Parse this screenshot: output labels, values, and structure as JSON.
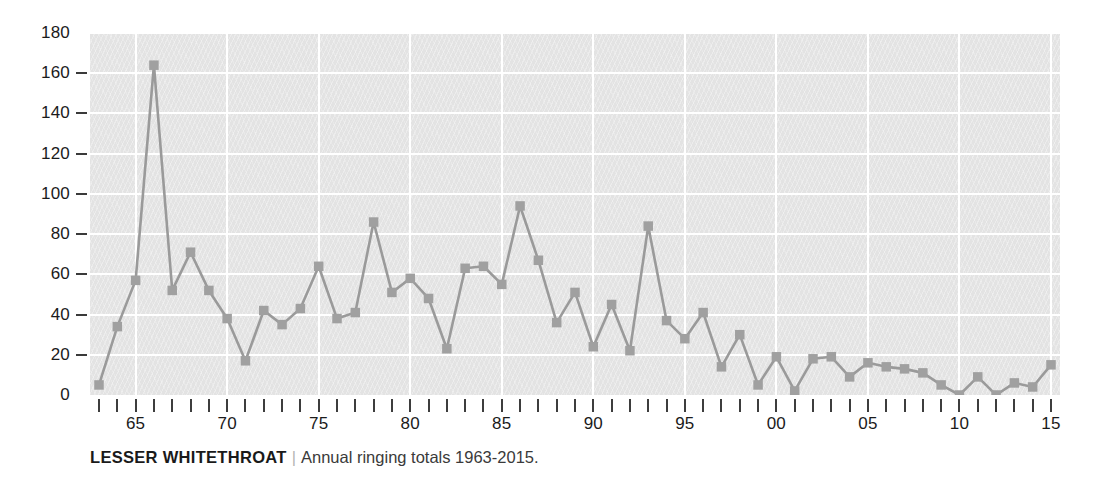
{
  "caption": {
    "title": "LESSER WHITETHROAT",
    "separator": "|",
    "subtitle": "Annual ringing totals 1963-2015."
  },
  "colors": {
    "plot_background": "#e3e3e3",
    "gridline": "#ffffff",
    "series_line": "#9a9a9a",
    "marker": "#a0a0a0",
    "axis_text": "#1b1b1b",
    "tick": "#3d3d3d",
    "page_background": "#ffffff"
  },
  "chart_data": {
    "type": "line",
    "title": "LESSER WHITETHROAT",
    "subtitle": "Annual ringing totals 1963-2015.",
    "xlabel": "",
    "ylabel": "",
    "ylim": [
      0,
      180
    ],
    "xlim": [
      1963,
      2015
    ],
    "grid": true,
    "legend": "none",
    "markers": "square",
    "ytick_labels": [
      "0",
      "20",
      "40",
      "60",
      "80",
      "100",
      "120",
      "140",
      "160",
      "180"
    ],
    "ytick_values": [
      0,
      20,
      40,
      60,
      80,
      100,
      120,
      140,
      160,
      180
    ],
    "xtick_labels": [
      "65",
      "70",
      "75",
      "80",
      "85",
      "90",
      "95",
      "00",
      "05",
      "10",
      "15"
    ],
    "xtick_values": [
      1965,
      1970,
      1975,
      1980,
      1985,
      1990,
      1995,
      2000,
      2005,
      2010,
      2015
    ],
    "x": [
      1963,
      1964,
      1965,
      1966,
      1967,
      1968,
      1969,
      1970,
      1971,
      1972,
      1973,
      1974,
      1975,
      1976,
      1977,
      1978,
      1979,
      1980,
      1981,
      1982,
      1983,
      1984,
      1985,
      1986,
      1987,
      1988,
      1989,
      1990,
      1991,
      1992,
      1993,
      1994,
      1995,
      1996,
      1997,
      1998,
      1999,
      2000,
      2001,
      2002,
      2003,
      2004,
      2005,
      2006,
      2007,
      2008,
      2009,
      2010,
      2011,
      2012,
      2013,
      2014,
      2015
    ],
    "values": [
      5,
      34,
      57,
      164,
      52,
      71,
      52,
      38,
      17,
      42,
      35,
      43,
      64,
      38,
      41,
      86,
      51,
      58,
      48,
      23,
      63,
      64,
      55,
      94,
      67,
      36,
      51,
      24,
      45,
      22,
      84,
      37,
      28,
      41,
      14,
      30,
      5,
      19,
      2,
      18,
      19,
      9,
      16,
      14,
      13,
      11,
      5,
      0,
      9,
      0,
      6,
      4,
      15
    ],
    "series": [
      {
        "name": "Annual ringing totals",
        "values": [
          5,
          34,
          57,
          164,
          52,
          71,
          52,
          38,
          17,
          42,
          35,
          43,
          64,
          38,
          41,
          86,
          51,
          58,
          48,
          23,
          63,
          64,
          55,
          94,
          67,
          36,
          51,
          24,
          45,
          22,
          84,
          37,
          28,
          41,
          14,
          30,
          5,
          19,
          2,
          18,
          19,
          9,
          16,
          14,
          13,
          11,
          5,
          0,
          9,
          0,
          6,
          4,
          15
        ]
      }
    ]
  }
}
